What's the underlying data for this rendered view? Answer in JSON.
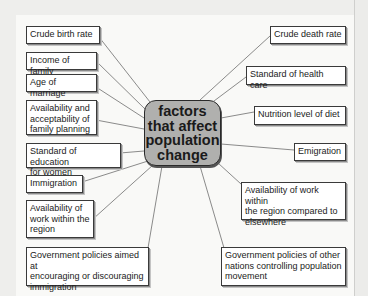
{
  "diagram": {
    "center": {
      "label": "factors\nthat affect\npopulation\nchange"
    },
    "left_factors": [
      {
        "label": "Crude birth rate"
      },
      {
        "label": "Income of family"
      },
      {
        "label": "Age of marriage"
      },
      {
        "label": "Availability and\nacceptability of\nfamily planning"
      },
      {
        "label": "Standard of education\nfor women"
      },
      {
        "label": "Immigration"
      },
      {
        "label": "Availability of\nwork within the\nregion"
      },
      {
        "label": "Government policies aimed at\nencouraging or discouraging\nimmigration"
      }
    ],
    "right_factors": [
      {
        "label": "Crude death rate"
      },
      {
        "label": "Standard of health care"
      },
      {
        "label": "Nutrition level of diet"
      },
      {
        "label": "Emigration"
      },
      {
        "label": "Availability of work within\nthe region compared to\nelsewhere"
      },
      {
        "label": "Government policies of other\nnations controlling population\nmovement"
      }
    ],
    "colors": {
      "center_fill": "#b0b0ae",
      "box_fill": "#ffffff",
      "line": "#555555",
      "background": "#f9f9f7"
    }
  }
}
